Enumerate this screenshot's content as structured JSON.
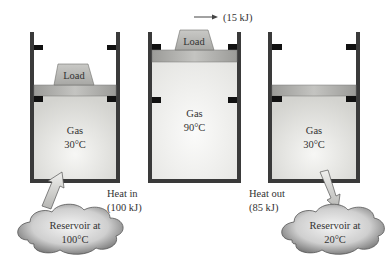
{
  "cylinders": [
    {
      "id": "state-1",
      "gas_label": "Gas",
      "gas_temp": "30°C",
      "load_label": "Load",
      "has_load": true
    },
    {
      "id": "state-2",
      "gas_label": "Gas",
      "gas_temp": "90°C",
      "load_label": "Load",
      "has_load": true,
      "work_label": "(15 kJ)"
    },
    {
      "id": "state-3",
      "gas_label": "Gas",
      "gas_temp": "30°C",
      "has_load": false
    }
  ],
  "heat_in": {
    "line1": "Heat in",
    "line2": "(100 kJ)"
  },
  "heat_out": {
    "line1": "Heat out",
    "line2": "(85 kJ)"
  },
  "reservoirs": [
    {
      "line1": "Reservoir at",
      "line2": "100°C"
    },
    {
      "line1": "Reservoir at",
      "line2": "20°C"
    }
  ],
  "colors": {
    "wall": "#3a3a3a",
    "stop": "#111111",
    "gas_light": "#f4f4f2",
    "gas_dark": "#d6d6d2",
    "piston": "#a9a9a6",
    "load": "#b8b8b4",
    "cloud_light": "#f2f2f2",
    "cloud_dark": "#8a8a8a"
  }
}
